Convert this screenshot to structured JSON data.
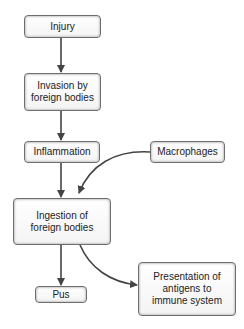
{
  "diagram": {
    "type": "flowchart",
    "nodes": [
      {
        "id": "injury",
        "label": "Injury"
      },
      {
        "id": "invasion",
        "label": "Invasion by foreign bodies"
      },
      {
        "id": "inflammation",
        "label": "Inflammation"
      },
      {
        "id": "macrophages",
        "label": "Macrophages"
      },
      {
        "id": "ingestion",
        "label": "Ingestion of foreign bodies"
      },
      {
        "id": "pus",
        "label": "Pus"
      },
      {
        "id": "presentation",
        "label": "Presentation of antigens to immune system"
      }
    ],
    "edges": [
      {
        "from": "injury",
        "to": "invasion"
      },
      {
        "from": "invasion",
        "to": "inflammation"
      },
      {
        "from": "inflammation",
        "to": "ingestion"
      },
      {
        "from": "macrophages",
        "to": "ingestion"
      },
      {
        "from": "ingestion",
        "to": "pus"
      },
      {
        "from": "ingestion",
        "to": "presentation"
      }
    ]
  },
  "labels": {
    "injury": "Injury",
    "invasion_line1": "Invasion by",
    "invasion_line2": "foreign bodies",
    "inflammation": "Inflammation",
    "macrophages": "Macrophages",
    "ingestion_line1": "Ingestion of",
    "ingestion_line2": "foreign bodies",
    "pus": "Pus",
    "presentation_line1": "Presentation of",
    "presentation_line2": "antigens to",
    "presentation_line3": "immune system"
  },
  "colors": {
    "border": "#6e6e6e",
    "arrow": "#444444",
    "text": "#222222"
  }
}
